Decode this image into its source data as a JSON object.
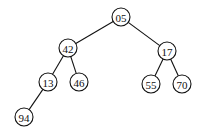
{
  "diagram": {
    "type": "binary-tree",
    "node_radius": 9,
    "colors": {
      "stroke": "#111111",
      "fill": "#ffffff",
      "text": "#111111"
    },
    "nodes": [
      {
        "id": "n05",
        "label": "05",
        "x": 121,
        "y": 17
      },
      {
        "id": "n42",
        "label": "42",
        "x": 68,
        "y": 48
      },
      {
        "id": "n17",
        "label": "17",
        "x": 167,
        "y": 51
      },
      {
        "id": "n13",
        "label": "13",
        "x": 48,
        "y": 82
      },
      {
        "id": "n46",
        "label": "46",
        "x": 79,
        "y": 82
      },
      {
        "id": "n55",
        "label": "55",
        "x": 151,
        "y": 84
      },
      {
        "id": "n70",
        "label": "70",
        "x": 182,
        "y": 84
      },
      {
        "id": "n94",
        "label": "94",
        "x": 24,
        "y": 117
      }
    ],
    "edges": [
      {
        "from": "n05",
        "to": "n42"
      },
      {
        "from": "n05",
        "to": "n17"
      },
      {
        "from": "n42",
        "to": "n13"
      },
      {
        "from": "n42",
        "to": "n46"
      },
      {
        "from": "n17",
        "to": "n55"
      },
      {
        "from": "n17",
        "to": "n70"
      },
      {
        "from": "n13",
        "to": "n94"
      }
    ]
  }
}
